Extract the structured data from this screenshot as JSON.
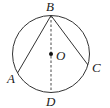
{
  "diagram": {
    "type": "geometry-circle",
    "colors": {
      "stroke": "#333333",
      "background": "#ffffff",
      "text": "#222222"
    },
    "circle": {
      "center": "O",
      "cx": 51,
      "cy": 54,
      "r": 38.5
    },
    "points": {
      "A": {
        "label": "A",
        "x": 17.5,
        "y": 73,
        "label_x": 7,
        "label_y": 83
      },
      "B": {
        "label": "B",
        "x": 51,
        "y": 15.5,
        "label_x": 46,
        "label_y": 11
      },
      "C": {
        "label": "C",
        "x": 88,
        "y": 65,
        "label_x": 92,
        "label_y": 72
      },
      "D": {
        "label": "D",
        "x": 51,
        "y": 92.5,
        "label_x": 46,
        "label_y": 106
      },
      "O": {
        "label": "O",
        "x": 51,
        "y": 54,
        "label_x": 56,
        "label_y": 60
      }
    },
    "segments": [
      {
        "from": "B",
        "to": "A",
        "style": "solid"
      },
      {
        "from": "B",
        "to": "C",
        "style": "solid"
      },
      {
        "from": "B",
        "to": "D",
        "style": "dashed"
      }
    ]
  }
}
